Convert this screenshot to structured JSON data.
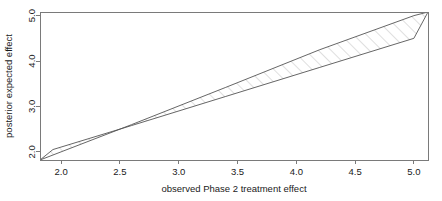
{
  "chart_data": {
    "type": "area",
    "title": "",
    "subtitle": "",
    "xlabel": "observed Phase 2 treatment effect",
    "ylabel": "posterior expected effect",
    "xlim": [
      1.82,
      5.12
    ],
    "ylim": [
      1.82,
      5.08
    ],
    "xticks": [
      2.0,
      2.5,
      3.0,
      3.5,
      4.0,
      4.5,
      5.0
    ],
    "xticklabels": [
      "2.0",
      "2.5",
      "3.0",
      "3.5",
      "4.0",
      "4.5",
      "5.0"
    ],
    "yticks": [
      2.0,
      3.0,
      4.0,
      5.0
    ],
    "yticklabels": [
      "2.0",
      "3.0",
      "4.0",
      "5.0"
    ],
    "grid": false,
    "legend": null,
    "annotations": [],
    "series": [
      {
        "name": "upper boundary",
        "type": "line",
        "color": "#555555",
        "x": [
          1.82,
          2.6,
          3.4,
          4.2,
          5.0,
          5.12
        ],
        "y": [
          1.82,
          2.6,
          3.42,
          4.25,
          5.0,
          5.08
        ]
      },
      {
        "name": "lower boundary",
        "type": "line",
        "color": "#555555",
        "x": [
          1.93,
          2.6,
          3.4,
          4.2,
          5.0
        ],
        "y": [
          2.05,
          2.58,
          3.22,
          3.86,
          4.5
        ]
      },
      {
        "name": "closing edge",
        "type": "line",
        "color": "#555555",
        "x": [
          5.0,
          5.0
        ],
        "y": [
          4.5,
          5.0
        ]
      }
    ],
    "shaded_region": {
      "name": "hatched credible band",
      "pattern": "diagonal-hatch",
      "hatch_angle_deg": 45,
      "hatch_color": "#b0b0b0",
      "fill": "none"
    }
  }
}
